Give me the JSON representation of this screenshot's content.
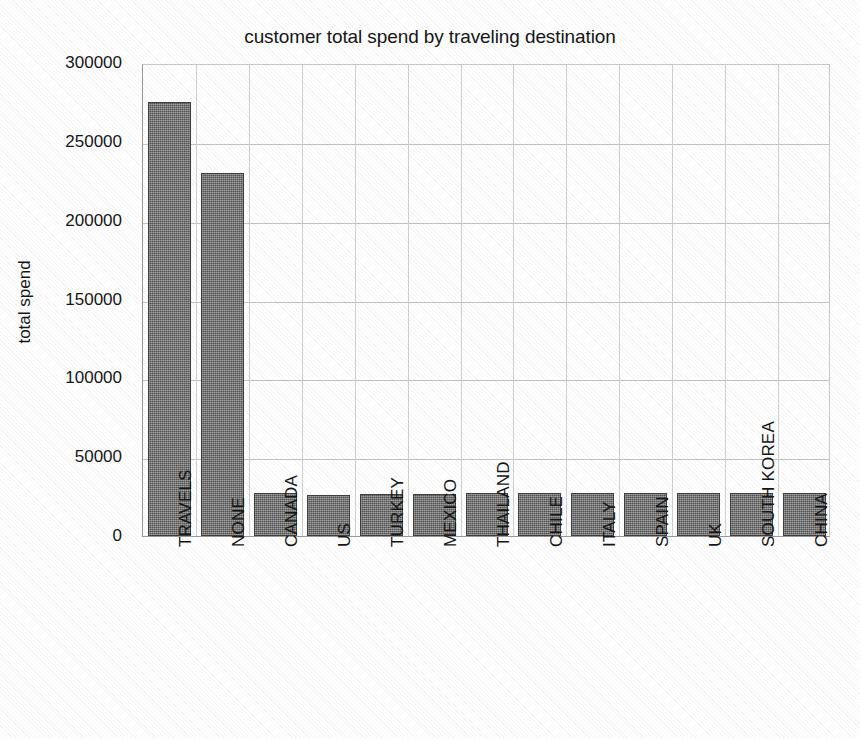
{
  "chart_data": {
    "type": "bar",
    "title": "customer total spend by traveling destination",
    "xlabel": "",
    "ylabel": "total spend",
    "categories": [
      "TRAVELS",
      "NONE",
      "CANADA",
      "US",
      "TURKEY",
      "MEXICO",
      "THAILAND",
      "CHILE",
      "ITALY",
      "SPAIN",
      "UK",
      "SOUTH KOREA",
      "CHINA"
    ],
    "values": [
      275000,
      230000,
      27000,
      26000,
      26500,
      26500,
      27000,
      27000,
      27000,
      27000,
      27500,
      27500,
      27500
    ],
    "ylim": [
      0,
      300000
    ],
    "ytick_labels": [
      "0",
      "50000",
      "100000",
      "150000",
      "200000",
      "250000",
      "300000"
    ],
    "ytick_values": [
      0,
      50000,
      100000,
      150000,
      200000,
      250000,
      300000
    ],
    "grid": true,
    "legend": false,
    "bar_color": "#6e6e6e",
    "bar_edge_color": "#3f3f3f",
    "grid_color": "#c2c2c2",
    "axis_color": "#9a9a9a",
    "background_color": "#ffffff"
  }
}
